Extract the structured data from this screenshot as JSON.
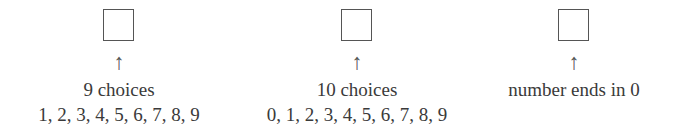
{
  "diagram": {
    "columns": [
      {
        "label": "9 choices",
        "detail": "1, 2, 3, 4, 5, 6, 7, 8, 9",
        "arrow": "↑"
      },
      {
        "label": "10 choices",
        "detail": "0, 1, 2, 3, 4, 5, 6, 7, 8, 9",
        "arrow": "↑"
      },
      {
        "label": "number ends in 0",
        "detail": "",
        "arrow": "↑"
      }
    ]
  }
}
